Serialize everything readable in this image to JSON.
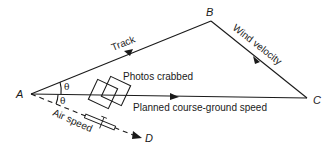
{
  "diagram": {
    "points": {
      "A": {
        "label": "A"
      },
      "B": {
        "label": "B"
      },
      "C": {
        "label": "C"
      },
      "D": {
        "label": "D"
      }
    },
    "labels": {
      "track": "Track",
      "wind_velocity": "Wind velocity",
      "photos_crabbed": "Photos crabbed",
      "planned_course": "Planned course-ground speed",
      "air_speed": "Air speed",
      "theta_upper": "θ",
      "theta_lower": "θ"
    },
    "colors": {
      "line": "#1a1a1a",
      "background": "#ffffff"
    }
  }
}
